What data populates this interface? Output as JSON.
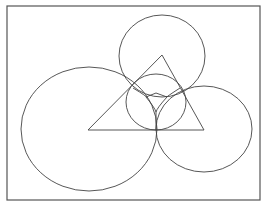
{
  "figure": {
    "caption_cut": "",
    "stroke_color": "#444444",
    "border": {
      "x": 7,
      "y": 6,
      "w": 253,
      "h": 194
    },
    "circles": [
      {
        "name": "top-circle",
        "cx": 162,
        "cy": 56,
        "rx": 43,
        "ry": 41
      },
      {
        "name": "left-circle",
        "cx": 89,
        "cy": 129,
        "rx": 68,
        "ry": 62
      },
      {
        "name": "right-circle",
        "cx": 204,
        "cy": 129,
        "rx": 48,
        "ry": 43
      },
      {
        "name": "incircle",
        "cx": 156,
        "cy": 102,
        "rx": 30,
        "ry": 28
      }
    ],
    "triangle": {
      "points": "162,55 88,130 204,130"
    }
  }
}
